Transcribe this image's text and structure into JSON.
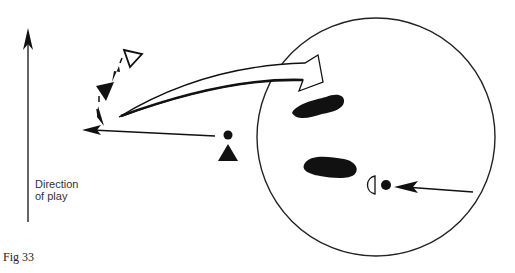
{
  "figure": {
    "caption": "Fig 33",
    "direction_label_line1": "Direction",
    "direction_label_line2": "of play"
  },
  "elements": {
    "direction_arrow": {
      "icon": "up-arrow-icon"
    },
    "circle_area": {
      "shape": "circle",
      "center": [
        376,
        137
      ],
      "radius": 119
    },
    "open_triangle": {
      "icon": "open-triangle-icon",
      "meaning": "player (outline)"
    },
    "filled_triangle_upper": {
      "icon": "filled-triangle-icon"
    },
    "filled_triangle_lower": {
      "icon": "filled-triangle-icon"
    },
    "ball_left": {
      "icon": "ball-icon"
    },
    "ball_right": {
      "icon": "ball-icon"
    },
    "half_circle_marker": {
      "icon": "half-circle-icon"
    },
    "footprints": {
      "icon": "footprint-icon",
      "count": 2
    },
    "large_curved_arrow": {
      "icon": "curved-open-arrow-icon"
    }
  },
  "colors": {
    "ink": "#111111",
    "background": "#ffffff"
  }
}
